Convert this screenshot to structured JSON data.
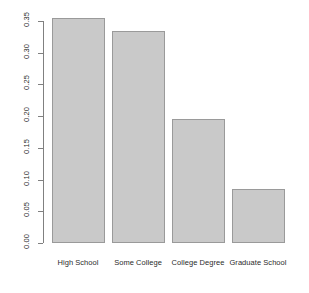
{
  "chart_data": {
    "type": "bar",
    "title": "",
    "subtitle": "",
    "xlabel": "",
    "ylabel": "",
    "categories": [
      "High School",
      "Some College",
      "College Degree",
      "Graduate School"
    ],
    "values": [
      0.355,
      0.335,
      0.195,
      0.085
    ],
    "ylim": [
      0.0,
      0.36
    ],
    "yticks": [
      "0.00",
      "0.05",
      "0.10",
      "0.15",
      "0.20",
      "0.25",
      "0.30",
      "0.35"
    ],
    "ytick_values": [
      0.0,
      0.05,
      0.1,
      0.15,
      0.2,
      0.25,
      0.3,
      0.35
    ],
    "grid": false,
    "legend": null,
    "bar_color": "#c9c9c9",
    "bar_border_color": "#9a9a9a",
    "axis_color": "#808080",
    "background": "#ffffff"
  },
  "plot": {
    "name": "education-level-barplot"
  }
}
